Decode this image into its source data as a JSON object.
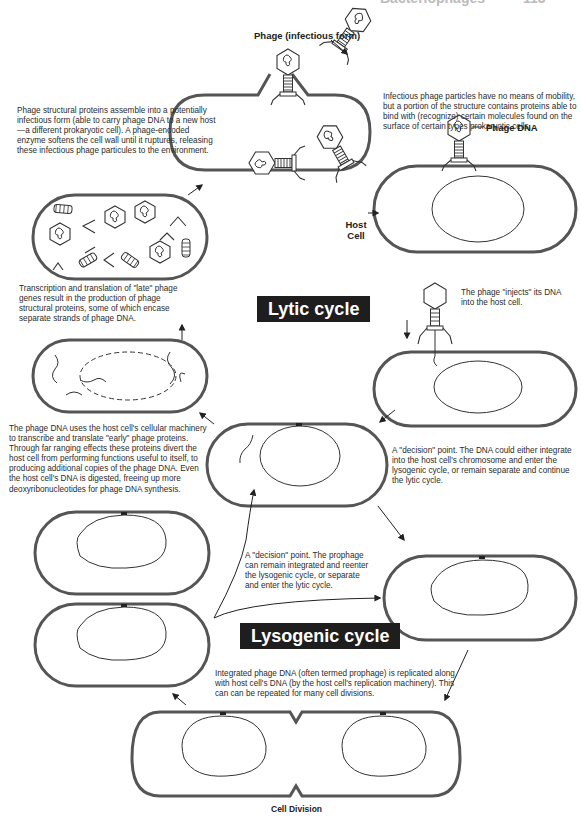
{
  "header": {
    "running_title": "Bacteriophages",
    "page_number": "113"
  },
  "diagram": {
    "title_lytic": "Lytic cycle",
    "title_lysogenic": "Lysogenic cycle",
    "labels": {
      "phage_infectious": "Phage (infectious form)",
      "phage_dna": "Phage DNA",
      "host_cell_line1": "Host",
      "host_cell_line2": "Cell",
      "cell_division": "Cell Division"
    },
    "descriptions": {
      "assembly": "Phage structural proteins assemble into a potentially infectious form (able to carry phage DNA to a new host—a different prokaryotic cell).  A phage-encoded enzyme softens the cell wall until it ruptures, releasing these infectious phage particules to the environment.",
      "attachment": "Infectious phage particles have no means of mobility, but a portion of the structure contains proteins able to bind with (recognize) certain molecules found on the surface of certain types prokaryotic cells.",
      "late_genes": "Transcription and translation of \"late\" phage genes result in the production of phage structural proteins, some of which encase separate strands of phage DNA.",
      "injection": "The phage \"injects\" its DNA into the host cell.",
      "early_genes": "The phage DNA uses the host cell's cellular machinery to transcribe and translate \"early\" phage proteins. Through far ranging effects these proteins divert the host cell from performing functions useful to itself, to producing additional copies of the phage DNA. Even the host cell's DNA is digested, freeing up more deoxyribonucleotides for phage DNA synthesis.",
      "decision_dna": "A \"decision\" point. The DNA could either integrate into the host cell's chromosome and enter the lysogenic cycle, or remain separate and continue the lytic cycle.",
      "decision_prophage": "A \"decision\" point. The prophage can remain integrated and reenter the lysogenic cycle, or separate and enter the lytic cycle.",
      "replication": "Integrated phage DNA (often termed prophage) is replicated along with host cell's DNA (by the host cell's replication machinery). This can can be repeated for many cell divisions."
    },
    "colors": {
      "badge_bg": "#1e1e1e",
      "badge_text": "#ffffff",
      "line": "#333333",
      "cell_wall": "#555555"
    }
  }
}
